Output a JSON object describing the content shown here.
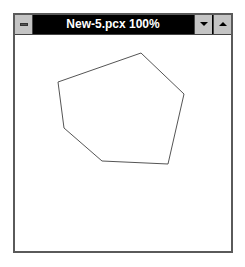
{
  "window": {
    "title": "New-5.pcx  100%",
    "controls": {
      "system_menu": "system-menu-icon",
      "minimize": "minimize-icon",
      "maximize": "maximize-icon"
    }
  },
  "canvas": {
    "shape": "polygon",
    "stroke": "#555555",
    "fill": "none",
    "points": "58,82 141,53 184,94 168,164 102,161 64,128"
  }
}
